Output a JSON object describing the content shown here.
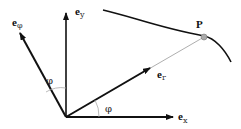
{
  "diagram": {
    "labels": {
      "ey": {
        "base": "e",
        "sub": "y"
      },
      "ephi": {
        "base": "e",
        "sub": "φ"
      },
      "er": {
        "base": "e",
        "sub": "r"
      },
      "ex": {
        "base": "e",
        "sub": "x"
      },
      "point": "P",
      "angle_top": "φ",
      "angle_bottom": "φ"
    },
    "colors": {
      "axis": "#111111",
      "radial_line": "#999999",
      "arc": "#aaaaaa",
      "point_fill": "#aaaaaa"
    }
  }
}
